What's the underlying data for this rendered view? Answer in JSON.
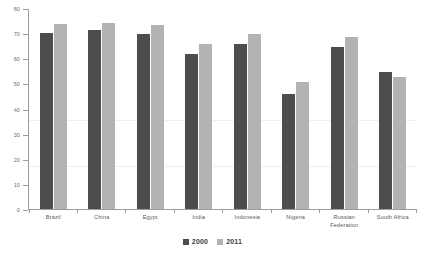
{
  "chart_data": {
    "type": "bar",
    "title": "",
    "subtitle": "",
    "xlabel": "",
    "ylabel": "",
    "ylim": [
      0,
      80
    ],
    "yticks": [
      0,
      10,
      20,
      30,
      40,
      50,
      60,
      70,
      80
    ],
    "grid": false,
    "legend_position": "bottom-center",
    "categories": [
      "Brazil",
      "China",
      "Egypt",
      "India",
      "Indonesia",
      "Nigeria",
      "Russian Federation",
      "South Africa"
    ],
    "category_lines": [
      [
        "Brazil"
      ],
      [
        "China"
      ],
      [
        "Egypt"
      ],
      [
        "India"
      ],
      [
        "Indonesia"
      ],
      [
        "Nigeria"
      ],
      [
        "Russian",
        "Federation"
      ],
      [
        "South Africa"
      ]
    ],
    "series": [
      {
        "name": "2000",
        "color": "#4d4d4f",
        "values": [
          70.5,
          71.5,
          70,
          62,
          66,
          46,
          65,
          55
        ]
      },
      {
        "name": "2011",
        "color": "#b1b3b4",
        "values": [
          74,
          74.5,
          73.5,
          66,
          70,
          51,
          69,
          53
        ]
      }
    ]
  },
  "legend": {
    "items": [
      {
        "label": "2000",
        "color": "#4d4d4f"
      },
      {
        "label": "2011",
        "color": "#b1b3b4"
      }
    ]
  },
  "axis": {
    "tick_labels": [
      "80",
      "70",
      "60",
      "50",
      "40",
      "30",
      "20",
      "10",
      "0"
    ],
    "max": 80,
    "min": 0
  },
  "colors": {
    "series_2000": "#4d4d4f",
    "series_2011": "#b1b3b4",
    "axis": "#9d9d9d",
    "text": "#58585a",
    "background": "#ffffff"
  }
}
